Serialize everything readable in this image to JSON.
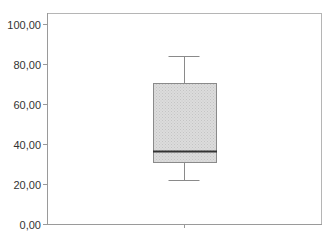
{
  "chart_data": {
    "type": "boxplot",
    "title": "",
    "xlabel": "",
    "ylabel": "",
    "ylim": [
      0,
      100
    ],
    "yticks": [
      0,
      20,
      40,
      60,
      80,
      100
    ],
    "ytick_labels": [
      "0,00",
      "20,00",
      "40,00",
      "60,00",
      "80,00",
      "100,00"
    ],
    "grid": false,
    "legend": null,
    "series": [
      {
        "name": "",
        "whisker_low": 22,
        "q1": 31,
        "median": 36.5,
        "q3": 70.5,
        "whisker_high": 84
      }
    ]
  },
  "colors": {
    "box_fill": "#d4d4d4",
    "box_stroke": "#8a8a8a",
    "median": "#333333",
    "axis": "#9a9a9a",
    "frame": "#b5b5b5",
    "text": "#333333"
  }
}
